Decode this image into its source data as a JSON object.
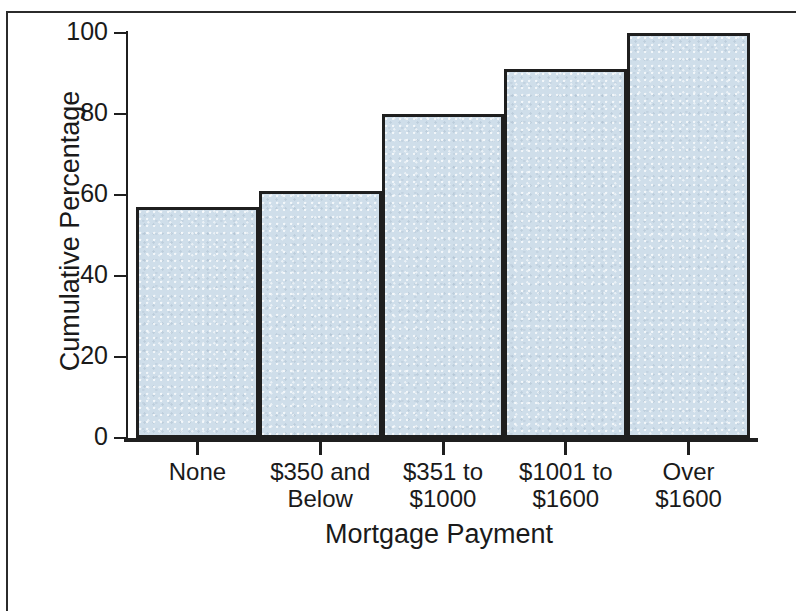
{
  "chart_data": {
    "type": "bar",
    "title": "",
    "subtitle": "",
    "xlabel": "Mortgage Payment",
    "ylabel": "Cumulative Percentage",
    "categories": [
      "None",
      "$350 and\nBelow",
      "$351 to\n$1000",
      "$1001 to\n$1600",
      "Over\n$1600"
    ],
    "values": [
      57,
      61,
      80,
      91,
      100
    ],
    "ylim": [
      0,
      100
    ],
    "yticks": [
      0,
      20,
      40,
      60,
      80,
      100
    ],
    "ytick_labels": [
      "0",
      "20",
      "40",
      "60",
      "80",
      "100"
    ],
    "grid": false,
    "legend": null,
    "bar_gap": "none",
    "annotations": []
  },
  "style": {
    "bar_fill_color": "#cfdeea",
    "bar_edge_color": "#1f1f1f",
    "axis_color": "#1f1f1f",
    "background_color": "#ffffff",
    "text_color": "#1a1a1a"
  }
}
